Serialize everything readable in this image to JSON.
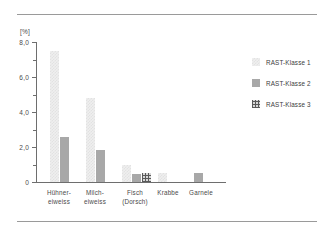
{
  "chart_data": {
    "type": "bar",
    "title": "",
    "subtitle": "",
    "xlabel": "",
    "ylabel": "[%]",
    "unit_label": "[%]",
    "ylim": [
      0,
      8.0
    ],
    "grid": false,
    "legend_position": "right",
    "y_ticks": [
      {
        "value": 8.0,
        "label": "8,0",
        "major": true
      },
      {
        "value": 7.0,
        "label": "",
        "major": false
      },
      {
        "value": 6.0,
        "label": "6,0",
        "major": true
      },
      {
        "value": 5.0,
        "label": "",
        "major": false
      },
      {
        "value": 4.0,
        "label": "4,0",
        "major": true
      },
      {
        "value": 3.0,
        "label": "",
        "major": false
      },
      {
        "value": 2.0,
        "label": "2,0",
        "major": true
      },
      {
        "value": 1.0,
        "label": "",
        "major": false
      },
      {
        "value": 0.0,
        "label": "0",
        "major": true
      }
    ],
    "categories": [
      "Hühner-\neiweiss",
      "Milch-\neiweiss",
      "Fisch\n(Dorsch)",
      "Krabbe",
      "Garnele"
    ],
    "series": [
      {
        "name": "RAST-Klasse 1",
        "color": "#e9e9e9",
        "pattern": "light-checker",
        "values": [
          7.5,
          4.8,
          0.95,
          0.5,
          0
        ]
      },
      {
        "name": "RAST-Klasse 2",
        "color": "#a8a8a8",
        "pattern": "solid-gray",
        "values": [
          2.6,
          1.85,
          0.45,
          0,
          0.5
        ]
      },
      {
        "name": "RAST-Klasse 3",
        "color": "#6a6a6a",
        "pattern": "cross-hatch",
        "values": [
          0,
          0,
          0.5,
          0,
          0
        ]
      }
    ]
  },
  "legend": {
    "items": [
      {
        "label": "RAST-Klasse 1"
      },
      {
        "label": "RAST-Klasse 2"
      },
      {
        "label": "RAST-Klasse 3"
      }
    ]
  }
}
